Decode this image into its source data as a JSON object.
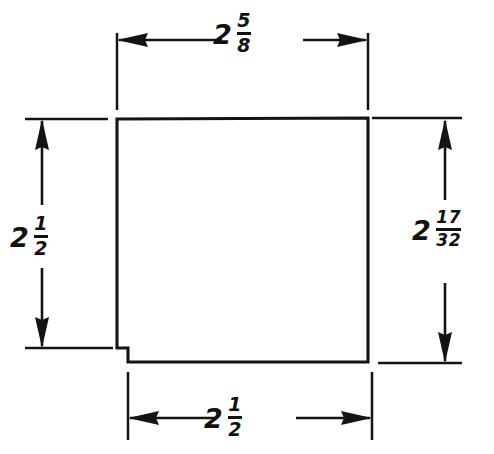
{
  "drawing": {
    "title": "Dimensioned square part with bottom-left notch",
    "background_color": "#ffffff",
    "line_color": "#141414",
    "dimensions": [
      {
        "id": "top",
        "name": "top-width-dimension",
        "whole": "2",
        "numerator": "5",
        "denominator": "8",
        "value_text": "2 5/8",
        "orientation": "horizontal",
        "position": "top",
        "measures": "overall top width"
      },
      {
        "id": "left",
        "name": "left-height-dimension",
        "whole": "2",
        "numerator": "1",
        "denominator": "2",
        "value_text": "2 1/2",
        "orientation": "vertical",
        "position": "left",
        "measures": "height to notch step"
      },
      {
        "id": "right",
        "name": "right-height-dimension",
        "whole": "2",
        "numerator": "17",
        "denominator": "32",
        "value_text": "2 17/32",
        "orientation": "vertical",
        "position": "right",
        "measures": "overall right height"
      },
      {
        "id": "bottom",
        "name": "bottom-width-dimension",
        "whole": "2",
        "numerator": "1",
        "denominator": "2",
        "value_text": "2 1/2",
        "orientation": "horizontal",
        "position": "bottom",
        "measures": "bottom width after notch"
      }
    ],
    "geometry": {
      "outline_points": "117,119 368,118 368,362 128,362 128,348 117,348",
      "notch": {
        "name": "bottom-left-notch",
        "step_x": 128,
        "step_y": 348,
        "corner_x": 117,
        "corner_y": 362
      }
    }
  }
}
